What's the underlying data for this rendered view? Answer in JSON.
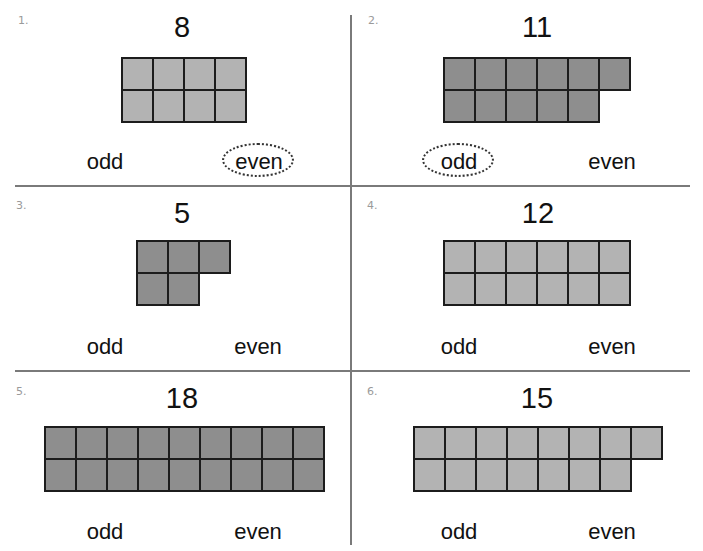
{
  "worksheet": {
    "problems": [
      {
        "number_label": "1.",
        "target": "8",
        "count": 8,
        "top_row": 4,
        "bottom_row": 4,
        "shade": "light",
        "options": [
          "odd",
          "even"
        ],
        "circled": "even"
      },
      {
        "number_label": "2.",
        "target": "11",
        "count": 11,
        "top_row": 6,
        "bottom_row": 5,
        "shade": "dark",
        "options": [
          "odd",
          "even"
        ],
        "circled": "odd"
      },
      {
        "number_label": "3.",
        "target": "5",
        "count": 5,
        "top_row": 3,
        "bottom_row": 2,
        "shade": "dark",
        "options": [
          "odd",
          "even"
        ],
        "circled": null
      },
      {
        "number_label": "4.",
        "target": "12",
        "count": 12,
        "top_row": 6,
        "bottom_row": 6,
        "shade": "light",
        "options": [
          "odd",
          "even"
        ],
        "circled": null
      },
      {
        "number_label": "5.",
        "target": "18",
        "count": 18,
        "top_row": 9,
        "bottom_row": 9,
        "shade": "dark",
        "options": [
          "odd",
          "even"
        ],
        "circled": null
      },
      {
        "number_label": "6.",
        "target": "15",
        "count": 15,
        "top_row": 8,
        "bottom_row": 7,
        "shade": "light",
        "options": [
          "odd",
          "even"
        ],
        "circled": null
      }
    ],
    "colors": {
      "light_cell": "#b3b3b3",
      "dark_cell": "#8e8e8e",
      "grid_line": "#1c1c1c",
      "divider": "#7a7a7a",
      "label_gray": "#9a9a9a"
    }
  }
}
